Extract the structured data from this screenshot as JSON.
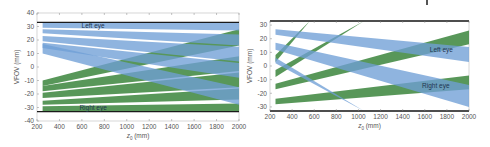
{
  "colors": {
    "left_eye_band": "#6f9fd6",
    "right_eye_band": "#4f9150",
    "overlap": "#3f7596",
    "limit_line": "#1a1a1a",
    "axis": "#888888",
    "label_text": "#1f3550"
  },
  "chart_data": [
    {
      "type": "area",
      "title": "",
      "xlabel": "z_0 (mm)",
      "ylabel": "VFOV (mm)",
      "xlim": [
        200,
        2000
      ],
      "ylim": [
        -40,
        40
      ],
      "xticks": [
        200,
        400,
        600,
        800,
        1000,
        1200,
        1400,
        1600,
        1800,
        2000
      ],
      "yticks": [
        -40,
        -30,
        -20,
        -10,
        0,
        10,
        20,
        30,
        40
      ],
      "grid": false,
      "limit_lines": [
        33,
        -33
      ],
      "annotations": [
        {
          "text": "Left eye",
          "x": 700,
          "y": 30.5
        },
        {
          "text": "Right eye",
          "x": 700,
          "y": -30.5
        }
      ],
      "series": [
        {
          "name": "Left eye band 1",
          "eye": "left",
          "x": [
            250,
            2000
          ],
          "upper": [
            33,
            33
          ],
          "lower": [
            29,
            27
          ]
        },
        {
          "name": "Left eye band 2",
          "eye": "left",
          "x": [
            250,
            2000
          ],
          "upper": [
            28,
            24
          ],
          "lower": [
            25,
            16
          ]
        },
        {
          "name": "Left eye band 3",
          "eye": "left",
          "x": [
            250,
            2000
          ],
          "upper": [
            23,
            15
          ],
          "lower": [
            19,
            4
          ]
        },
        {
          "name": "Left eye band 4",
          "eye": "left",
          "x": [
            250,
            2000
          ],
          "upper": [
            18,
            3
          ],
          "lower": [
            14,
            -8
          ]
        },
        {
          "name": "Left eye band 5",
          "eye": "left",
          "x": [
            250,
            2000
          ],
          "upper": [
            17,
            -15
          ],
          "lower": [
            10,
            -28
          ]
        },
        {
          "name": "Right eye band 1",
          "eye": "right",
          "x": [
            250,
            2000
          ],
          "upper": [
            -29,
            -27
          ],
          "lower": [
            -33,
            -33
          ]
        },
        {
          "name": "Right eye band 2",
          "eye": "right",
          "x": [
            250,
            2000
          ],
          "upper": [
            -25,
            -16
          ],
          "lower": [
            -28,
            -24
          ]
        },
        {
          "name": "Right eye band 3",
          "eye": "right",
          "x": [
            250,
            2000
          ],
          "upper": [
            -19,
            -4
          ],
          "lower": [
            -23,
            -15
          ]
        },
        {
          "name": "Right eye band 4",
          "eye": "right",
          "x": [
            250,
            2000
          ],
          "upper": [
            -14,
            8
          ],
          "lower": [
            -18,
            -3
          ]
        },
        {
          "name": "Right eye band 5",
          "eye": "right",
          "x": [
            250,
            2000
          ],
          "upper": [
            -10,
            28
          ],
          "lower": [
            -14,
            16
          ]
        }
      ]
    },
    {
      "type": "area",
      "title": "",
      "xlabel": "z_0 (mm)",
      "ylabel": "VFOV (mm)",
      "xlim": [
        200,
        2000
      ],
      "ylim": [
        -33,
        33
      ],
      "xticks": [
        200,
        400,
        600,
        800,
        1000,
        1200,
        1400,
        1600,
        1800,
        2000
      ],
      "yticks": [
        -30,
        -20,
        -10,
        0,
        10,
        20,
        30
      ],
      "grid": false,
      "limit_lines": [
        33,
        -33
      ],
      "annotations": [
        {
          "text": "Left eye",
          "x": 1750,
          "y": 12
        },
        {
          "text": "Right eye",
          "x": 1700,
          "y": -15
        }
      ],
      "series": [
        {
          "name": "Left eye band 1",
          "eye": "left",
          "x": [
            250,
            2000
          ],
          "upper": [
            27,
            14
          ],
          "lower": [
            23,
            3
          ]
        },
        {
          "name": "Left eye band 2",
          "eye": "left",
          "x": [
            250,
            2000
          ],
          "upper": [
            17,
            -14
          ],
          "lower": [
            12,
            -30
          ]
        },
        {
          "name": "Left eye band 3",
          "eye": "left",
          "x": [
            250,
            1050
          ],
          "upper": [
            6,
            -33
          ],
          "lower": [
            2,
            -33
          ]
        },
        {
          "name": "Right eye band 1",
          "eye": "right",
          "x": [
            250,
            2000
          ],
          "upper": [
            -24,
            -7
          ],
          "lower": [
            -28,
            -17
          ]
        },
        {
          "name": "Right eye band 2",
          "eye": "right",
          "x": [
            250,
            2000
          ],
          "upper": [
            -13,
            26
          ],
          "lower": [
            -17,
            16
          ]
        },
        {
          "name": "Right eye band 3",
          "eye": "right",
          "x": [
            250,
            1050
          ],
          "upper": [
            -3,
            33
          ],
          "lower": [
            -8,
            33
          ]
        },
        {
          "name": "Right eye band 4",
          "eye": "right",
          "x": [
            250,
            560
          ],
          "upper": [
            8,
            33
          ],
          "lower": [
            3,
            33
          ]
        }
      ]
    }
  ]
}
